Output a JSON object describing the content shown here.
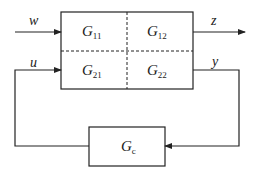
{
  "diagram": {
    "type": "generalized-plant-feedback-block-diagram",
    "plant": {
      "blocks": [
        {
          "id": "G11",
          "base": "G",
          "sub": "11"
        },
        {
          "id": "G12",
          "base": "G",
          "sub": "12"
        },
        {
          "id": "G21",
          "base": "G",
          "sub": "21"
        },
        {
          "id": "G22",
          "base": "G",
          "sub": "22"
        }
      ]
    },
    "controller": {
      "id": "Gc",
      "base": "G",
      "sub": "c"
    },
    "signals": {
      "w": "w",
      "z": "z",
      "u": "u",
      "y": "y"
    },
    "colors": {
      "line": "#222222",
      "background": "#ffffff"
    }
  }
}
